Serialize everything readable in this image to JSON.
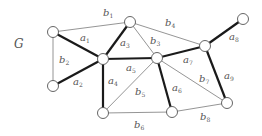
{
  "graph": {
    "name": "G",
    "nodes": [
      {
        "id": "n1",
        "x": 53,
        "y": 32
      },
      {
        "id": "n2",
        "x": 130,
        "y": 22
      },
      {
        "id": "n3",
        "x": 103,
        "y": 59
      },
      {
        "id": "n4",
        "x": 157,
        "y": 58
      },
      {
        "id": "n5",
        "x": 205,
        "y": 46
      },
      {
        "id": "n6",
        "x": 243,
        "y": 19
      },
      {
        "id": "n7",
        "x": 53,
        "y": 86
      },
      {
        "id": "n8",
        "x": 103,
        "y": 113
      },
      {
        "id": "n9",
        "x": 172,
        "y": 112
      },
      {
        "id": "n10",
        "x": 227,
        "y": 103
      }
    ],
    "edges": [
      {
        "id": "b1",
        "letter": "b",
        "index": "1",
        "from": "n1",
        "to": "n2",
        "style": "thin",
        "lx": 103,
        "ly": 16
      },
      {
        "id": "a1",
        "letter": "a",
        "index": "1",
        "from": "n1",
        "to": "n3",
        "style": "thick",
        "lx": 80,
        "ly": 41
      },
      {
        "id": "b2",
        "letter": "b",
        "index": "2",
        "from": "n1",
        "to": "n7",
        "style": "thin",
        "lx": 59,
        "ly": 63
      },
      {
        "id": "a2",
        "letter": "a",
        "index": "2",
        "from": "n7",
        "to": "n3",
        "style": "thick",
        "lx": 73,
        "ly": 85
      },
      {
        "id": "a3",
        "letter": "a",
        "index": "3",
        "from": "n2",
        "to": "n3",
        "style": "thick",
        "lx": 120,
        "ly": 46
      },
      {
        "id": "b3",
        "letter": "b",
        "index": "3",
        "from": "n2",
        "to": "n4",
        "style": "thin",
        "lx": 150,
        "ly": 44
      },
      {
        "id": "b4",
        "letter": "b",
        "index": "4",
        "from": "n2",
        "to": "n5",
        "style": "thin",
        "lx": 165,
        "ly": 26
      },
      {
        "id": "a5",
        "letter": "a",
        "index": "5",
        "from": "n3",
        "to": "n4",
        "style": "thick",
        "lx": 126,
        "ly": 71
      },
      {
        "id": "a4",
        "letter": "a",
        "index": "4",
        "from": "n3",
        "to": "n8",
        "style": "thick",
        "lx": 108,
        "ly": 84
      },
      {
        "id": "b5",
        "letter": "b",
        "index": "5",
        "from": "n8",
        "to": "n4",
        "style": "thin",
        "lx": 135,
        "ly": 95
      },
      {
        "id": "a6",
        "letter": "a",
        "index": "6",
        "from": "n4",
        "to": "n9",
        "style": "thick",
        "lx": 172,
        "ly": 91
      },
      {
        "id": "a7",
        "letter": "a",
        "index": "7",
        "from": "n4",
        "to": "n5",
        "style": "thick",
        "lx": 183,
        "ly": 63
      },
      {
        "id": "b7",
        "letter": "b",
        "index": "7",
        "from": "n4",
        "to": "n10",
        "style": "thin",
        "lx": 199,
        "ly": 82
      },
      {
        "id": "a8",
        "letter": "a",
        "index": "8",
        "from": "n5",
        "to": "n6",
        "style": "thick",
        "lx": 229,
        "ly": 40
      },
      {
        "id": "a9",
        "letter": "a",
        "index": "9",
        "from": "n5",
        "to": "n10",
        "style": "thick",
        "lx": 224,
        "ly": 79
      },
      {
        "id": "b6",
        "letter": "b",
        "index": "6",
        "from": "n8",
        "to": "n9",
        "style": "thin",
        "lx": 134,
        "ly": 128
      },
      {
        "id": "b8",
        "letter": "b",
        "index": "8",
        "from": "n9",
        "to": "n10",
        "style": "thin",
        "lx": 200,
        "ly": 120
      }
    ]
  },
  "labels": {
    "graph_name": "G"
  }
}
